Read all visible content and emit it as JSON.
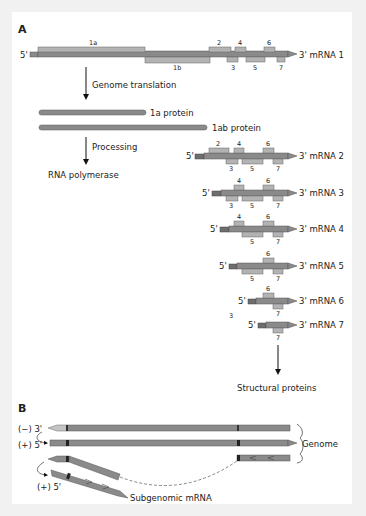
{
  "panel_a": {
    "label": "A",
    "genome": {
      "five_prime": "5'",
      "three_prime": "3' mRNA 1",
      "orf_1a": "1a",
      "orf_1b": "1b",
      "genes": [
        "2",
        "3",
        "4",
        "5",
        "6",
        "7"
      ]
    },
    "step_translation": "Genome translation",
    "protein_1a": "1a protein",
    "protein_1ab": "1ab protein",
    "step_processing": "Processing",
    "rna_polymerase": "RNA polymerase",
    "mrnas": [
      {
        "five": "5'",
        "three": "3' mRNA 2",
        "top": [
          "2",
          "4",
          "6"
        ],
        "bottom": [
          "3",
          "5",
          "7"
        ]
      },
      {
        "five": "5'",
        "three": "3' mRNA 3",
        "top": [
          "4",
          "6"
        ],
        "bottom": [
          "3",
          "5",
          "7"
        ]
      },
      {
        "five": "5'",
        "three": "3' mRNA 4",
        "top": [
          "4",
          "6"
        ],
        "bottom": [
          "5",
          "7"
        ]
      },
      {
        "five": "5'",
        "three": "3' mRNA 5",
        "top": [
          "6"
        ],
        "bottom": [
          "5",
          "7"
        ]
      },
      {
        "five": "5'",
        "three": "3' mRNA 6",
        "top": [
          "6"
        ],
        "bottom": [
          "7"
        ],
        "stray": "3"
      },
      {
        "five": "5'",
        "three": "3' mRNA 7",
        "top": [],
        "bottom": [
          "7"
        ]
      }
    ],
    "structural_proteins": "Structural proteins"
  },
  "panel_b": {
    "label": "B",
    "minus_strand": "(−) 3'",
    "plus_strand": "(+) 5'",
    "genome": "Genome",
    "subgenomic_plus": "(+) 5'",
    "subgenomic_mrna": "Subgenomic mRNA"
  },
  "colors": {
    "bar_dark": "#8a8a8a",
    "bar_light": "#b3b3b3",
    "bar_outline": "#555555",
    "leader": "#6e6e6e",
    "background": "#f1f1f1",
    "panel": "#ffffff"
  }
}
